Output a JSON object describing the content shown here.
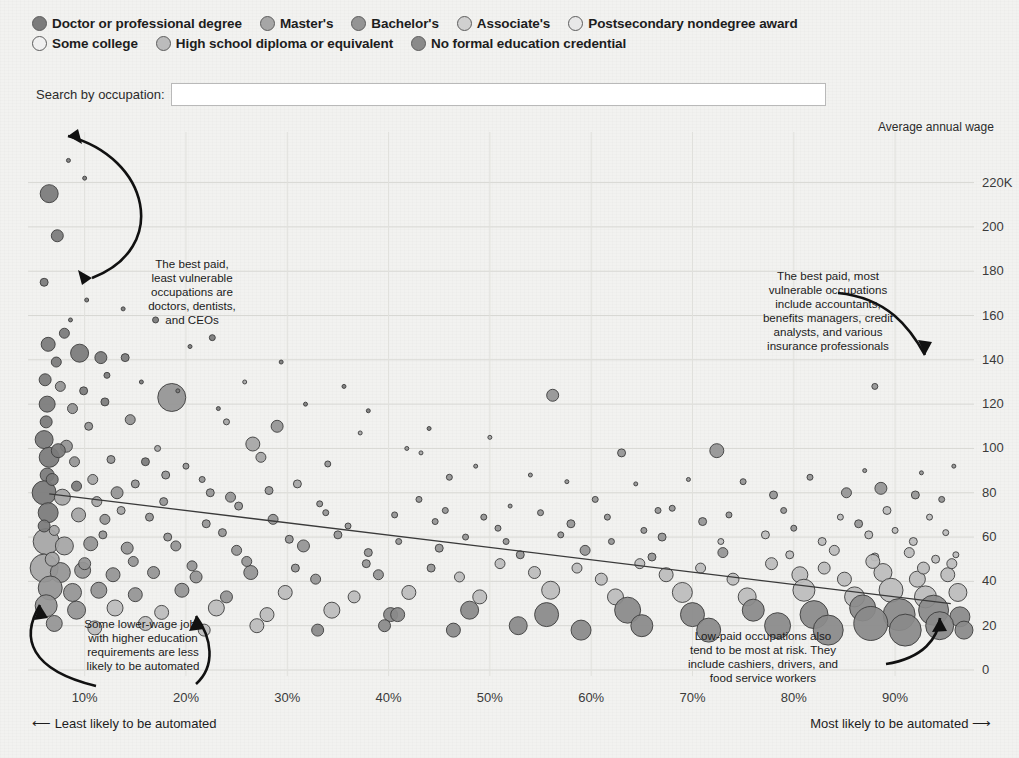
{
  "legend": {
    "rows": [
      [
        {
          "label": "Doctor or professional degree",
          "color": "#7b7b7b"
        },
        {
          "label": "Master's",
          "color": "#a6a6a6"
        },
        {
          "label": "Bachelor's",
          "color": "#949494"
        },
        {
          "label": "Associate's",
          "color": "#d0d0d0"
        },
        {
          "label": "Postsecondary nondegree award",
          "color": "#e2e2e2"
        }
      ],
      [
        {
          "label": "Some college",
          "color": "#ececec"
        },
        {
          "label": "High school diploma or equivalent",
          "color": "#bcbcbc"
        },
        {
          "label": "No formal education credential",
          "color": "#8a8a8a"
        }
      ]
    ]
  },
  "search": {
    "label": "Search by occupation:",
    "value": "",
    "placeholder": ""
  },
  "annotations": [
    {
      "name": "top-left-annotation",
      "lines": [
        "The best paid,",
        "least vulnerable",
        "occupations are",
        "doctors, dentists,",
        "and CEOs"
      ],
      "x": 192,
      "y": 150
    },
    {
      "name": "top-right-annotation",
      "lines": [
        "The best paid, most",
        "vulnerable occupations",
        "include accountants,",
        "benefits managers, credit",
        "analysts, and various",
        "insurance professionals"
      ],
      "x": 828,
      "y": 162
    },
    {
      "name": "bottom-left-annotation",
      "lines": [
        "Some lower-wage jobs",
        "with higher education",
        "requirements are less",
        "likely to be automated"
      ],
      "x": 143,
      "y": 510
    },
    {
      "name": "bottom-right-annotation",
      "lines": [
        "Low-paid occupations also",
        "tend to be most at risk. They",
        "include cashiers, drivers, and",
        "food service workers"
      ],
      "x": 763,
      "y": 522
    }
  ],
  "footer": {
    "left": "Least likely to be automated",
    "right": "Most likely to be automated"
  },
  "chart_data": {
    "type": "scatter",
    "title": "",
    "xlabel": "",
    "ylabel": "Average annual wage",
    "xlim": [
      5,
      97
    ],
    "ylim": [
      0,
      232
    ],
    "grid": true,
    "legend_position": "top",
    "x_ticks": [
      10,
      20,
      30,
      40,
      50,
      60,
      70,
      80,
      90
    ],
    "x_tick_labels": [
      "10%",
      "20%",
      "30%",
      "40%",
      "50%",
      "60%",
      "70%",
      "80%",
      "90%"
    ],
    "y_ticks": [
      0,
      20,
      40,
      60,
      80,
      100,
      120,
      140,
      160,
      180,
      200,
      220
    ],
    "y_tick_labels": [
      "0",
      "20",
      "40",
      "60",
      "80",
      "100",
      "120",
      "140",
      "160",
      "180",
      "200",
      "220K"
    ],
    "trendline": {
      "x0": 6.5,
      "y0": 79.5,
      "x1": 95.5,
      "y1": 30.0
    },
    "categories": [
      "Doctor or professional degree",
      "Master's",
      "Bachelor's",
      "Associate's",
      "Postsecondary nondegree award",
      "Some college",
      "High school diploma or equivalent",
      "No formal education credential"
    ],
    "category_colors": [
      "#7b7b7b",
      "#a6a6a6",
      "#949494",
      "#d0d0d0",
      "#e2e2e2",
      "#ececec",
      "#bcbcbc",
      "#8a8a8a"
    ],
    "size_encoding": "number of people employed",
    "points": [
      [
        6.5,
        215,
        9,
        0
      ],
      [
        7.3,
        196,
        6,
        0
      ],
      [
        6.0,
        175,
        4,
        0
      ],
      [
        8.4,
        230,
        2,
        0
      ],
      [
        10.0,
        222,
        2,
        0
      ],
      [
        6.4,
        147,
        7,
        0
      ],
      [
        8.0,
        152,
        5,
        0
      ],
      [
        9.5,
        143,
        9,
        0
      ],
      [
        7.2,
        139,
        5,
        0
      ],
      [
        11.6,
        141,
        6,
        0
      ],
      [
        14.0,
        141,
        4,
        0
      ],
      [
        22.6,
        150,
        3,
        0
      ],
      [
        6.1,
        131,
        6,
        0
      ],
      [
        7.6,
        128,
        5,
        2
      ],
      [
        9.9,
        126,
        4,
        0
      ],
      [
        6.3,
        120,
        8,
        0
      ],
      [
        8.8,
        118,
        5,
        2
      ],
      [
        12.0,
        121,
        4,
        0
      ],
      [
        18.6,
        123,
        14,
        2
      ],
      [
        6.2,
        112,
        6,
        0
      ],
      [
        10.4,
        110,
        4,
        2
      ],
      [
        14.5,
        113,
        5,
        2
      ],
      [
        24.0,
        112,
        3,
        1
      ],
      [
        29.0,
        110,
        6,
        2
      ],
      [
        6.0,
        104,
        9,
        0
      ],
      [
        8.2,
        101,
        6,
        2
      ],
      [
        17.2,
        100,
        3,
        1
      ],
      [
        26.6,
        102,
        7,
        1
      ],
      [
        41.8,
        100,
        2,
        2
      ],
      [
        6.5,
        96,
        10,
        0
      ],
      [
        9.0,
        94,
        5,
        2
      ],
      [
        12.6,
        95,
        4,
        2
      ],
      [
        20.0,
        92,
        3,
        2
      ],
      [
        27.4,
        96,
        5,
        1
      ],
      [
        34.0,
        93,
        3,
        2
      ],
      [
        56.2,
        124,
        6,
        2
      ],
      [
        6.3,
        88,
        7,
        0
      ],
      [
        10.8,
        86,
        5,
        1
      ],
      [
        15.0,
        84,
        4,
        2
      ],
      [
        21.6,
        86,
        3,
        2
      ],
      [
        31.0,
        84,
        4,
        1
      ],
      [
        46.0,
        87,
        3,
        2
      ],
      [
        63.0,
        98,
        4,
        2
      ],
      [
        72.4,
        99,
        7,
        2
      ],
      [
        6.0,
        80,
        12,
        0
      ],
      [
        7.8,
        78,
        8,
        1
      ],
      [
        13.2,
        80,
        6,
        2
      ],
      [
        17.8,
        76,
        4,
        2
      ],
      [
        24.4,
        78,
        5,
        2
      ],
      [
        33.2,
        75,
        3,
        2
      ],
      [
        43.0,
        77,
        3,
        2
      ],
      [
        52.0,
        74,
        2,
        2
      ],
      [
        60.4,
        77,
        3,
        2
      ],
      [
        68.0,
        73,
        3,
        2
      ],
      [
        78.0,
        79,
        4,
        2
      ],
      [
        85.2,
        80,
        5,
        2
      ],
      [
        88.6,
        82,
        6,
        2
      ],
      [
        92.0,
        79,
        4,
        2
      ],
      [
        94.6,
        77,
        3,
        2
      ],
      [
        6.4,
        71,
        10,
        0
      ],
      [
        9.4,
        70,
        7,
        1
      ],
      [
        12.0,
        68,
        5,
        2
      ],
      [
        16.4,
        69,
        4,
        2
      ],
      [
        22.0,
        66,
        4,
        2
      ],
      [
        28.6,
        68,
        5,
        2
      ],
      [
        36.0,
        65,
        3,
        2
      ],
      [
        44.6,
        67,
        3,
        2
      ],
      [
        50.8,
        64,
        3,
        2
      ],
      [
        58.0,
        66,
        4,
        2
      ],
      [
        65.2,
        63,
        3,
        2
      ],
      [
        71.0,
        67,
        4,
        2
      ],
      [
        80.0,
        64,
        3,
        2
      ],
      [
        86.4,
        66,
        4,
        2
      ],
      [
        90.0,
        63,
        3,
        6
      ],
      [
        95.0,
        62,
        3,
        6
      ],
      [
        6.2,
        58,
        13,
        1
      ],
      [
        8.0,
        56,
        9,
        1
      ],
      [
        10.6,
        57,
        7,
        2
      ],
      [
        14.2,
        55,
        6,
        2
      ],
      [
        19.0,
        56,
        5,
        2
      ],
      [
        25.0,
        54,
        5,
        2
      ],
      [
        31.6,
        56,
        6,
        2
      ],
      [
        38.0,
        53,
        4,
        2
      ],
      [
        45.0,
        55,
        4,
        2
      ],
      [
        53.0,
        52,
        4,
        2
      ],
      [
        59.4,
        54,
        5,
        2
      ],
      [
        66.0,
        51,
        4,
        2
      ],
      [
        73.0,
        53,
        5,
        2
      ],
      [
        79.6,
        52,
        4,
        6
      ],
      [
        84.0,
        54,
        5,
        6
      ],
      [
        88.0,
        51,
        4,
        6
      ],
      [
        91.4,
        53,
        5,
        6
      ],
      [
        94.0,
        50,
        4,
        6
      ],
      [
        96.0,
        52,
        3,
        6
      ],
      [
        6.0,
        46,
        14,
        1
      ],
      [
        7.6,
        44,
        10,
        2
      ],
      [
        9.8,
        45,
        8,
        2
      ],
      [
        12.8,
        43,
        7,
        2
      ],
      [
        16.8,
        44,
        6,
        2
      ],
      [
        21.0,
        42,
        6,
        2
      ],
      [
        26.4,
        44,
        7,
        2
      ],
      [
        32.8,
        41,
        5,
        2
      ],
      [
        39.0,
        43,
        5,
        2
      ],
      [
        47.0,
        42,
        5,
        6
      ],
      [
        54.4,
        44,
        6,
        6
      ],
      [
        61.0,
        41,
        6,
        6
      ],
      [
        67.4,
        43,
        7,
        6
      ],
      [
        74.0,
        41,
        6,
        6
      ],
      [
        80.6,
        43,
        8,
        6
      ],
      [
        85.0,
        41,
        7,
        6
      ],
      [
        88.8,
        44,
        9,
        6
      ],
      [
        92.2,
        41,
        8,
        6
      ],
      [
        95.2,
        43,
        7,
        6
      ],
      [
        6.6,
        37,
        12,
        2
      ],
      [
        8.8,
        35,
        9,
        2
      ],
      [
        11.4,
        36,
        8,
        2
      ],
      [
        15.0,
        34,
        7,
        2
      ],
      [
        19.6,
        36,
        7,
        2
      ],
      [
        24.0,
        33,
        6,
        2
      ],
      [
        29.8,
        35,
        7,
        6
      ],
      [
        36.6,
        33,
        6,
        6
      ],
      [
        42.0,
        35,
        7,
        6
      ],
      [
        49.0,
        33,
        7,
        6
      ],
      [
        56.0,
        36,
        9,
        6
      ],
      [
        62.4,
        33,
        8,
        6
      ],
      [
        69.0,
        35,
        10,
        6
      ],
      [
        75.4,
        33,
        9,
        6
      ],
      [
        81.0,
        36,
        11,
        6
      ],
      [
        86.0,
        33,
        10,
        6
      ],
      [
        89.6,
        36,
        12,
        6
      ],
      [
        93.0,
        33,
        11,
        6
      ],
      [
        96.2,
        35,
        9,
        6
      ],
      [
        6.2,
        29,
        11,
        2
      ],
      [
        9.2,
        27,
        9,
        2
      ],
      [
        13.0,
        28,
        8,
        6
      ],
      [
        17.6,
        26,
        7,
        6
      ],
      [
        23.0,
        28,
        8,
        6
      ],
      [
        28.0,
        25,
        7,
        6
      ],
      [
        34.4,
        27,
        8,
        6
      ],
      [
        40.2,
        25,
        7,
        7
      ],
      [
        40.9,
        25,
        7,
        7
      ],
      [
        48.0,
        27,
        9,
        7
      ],
      [
        55.6,
        25,
        12,
        7
      ],
      [
        63.6,
        27,
        13,
        7
      ],
      [
        70.0,
        25,
        12,
        7
      ],
      [
        76.0,
        27,
        11,
        7
      ],
      [
        82.0,
        25,
        14,
        7
      ],
      [
        86.8,
        28,
        13,
        7
      ],
      [
        90.4,
        25,
        16,
        7
      ],
      [
        93.8,
        27,
        15,
        7
      ],
      [
        96.4,
        24,
        10,
        7
      ],
      [
        7.0,
        21,
        8,
        2
      ],
      [
        11.0,
        19,
        7,
        6
      ],
      [
        16.0,
        21,
        7,
        6
      ],
      [
        21.8,
        18,
        6,
        6
      ],
      [
        27.0,
        20,
        7,
        6
      ],
      [
        33.0,
        18,
        6,
        7
      ],
      [
        39.6,
        20,
        6,
        7
      ],
      [
        46.4,
        18,
        7,
        7
      ],
      [
        52.8,
        20,
        9,
        7
      ],
      [
        59.0,
        18,
        10,
        7
      ],
      [
        65.0,
        20,
        11,
        7
      ],
      [
        71.6,
        18,
        12,
        7
      ],
      [
        78.4,
        20,
        13,
        7
      ],
      [
        83.4,
        18,
        15,
        7
      ],
      [
        87.6,
        21,
        17,
        7
      ],
      [
        91.0,
        18,
        16,
        7
      ],
      [
        94.4,
        20,
        14,
        7
      ],
      [
        96.8,
        18,
        9,
        7
      ],
      [
        88.0,
        128,
        3,
        2
      ],
      [
        38.0,
        117,
        2,
        0
      ],
      [
        44.0,
        109,
        2,
        0
      ],
      [
        50.0,
        105,
        2,
        1
      ],
      [
        35.6,
        128,
        2,
        0
      ],
      [
        29.4,
        139,
        2,
        0
      ],
      [
        13.8,
        163,
        2,
        0
      ],
      [
        17.0,
        158,
        3,
        0
      ],
      [
        20.4,
        146,
        2,
        0
      ],
      [
        10.2,
        167,
        2,
        0
      ],
      [
        8.6,
        158,
        2,
        0
      ],
      [
        12.2,
        133,
        3,
        0
      ],
      [
        15.6,
        130,
        2,
        0
      ],
      [
        19.2,
        126,
        2,
        0
      ],
      [
        23.2,
        118,
        2,
        0
      ],
      [
        25.8,
        130,
        2,
        1
      ],
      [
        31.8,
        120,
        2,
        0
      ],
      [
        37.2,
        107,
        2,
        1
      ],
      [
        43.2,
        98,
        2,
        1
      ],
      [
        48.6,
        92,
        2,
        2
      ],
      [
        54.0,
        88,
        2,
        2
      ],
      [
        57.6,
        85,
        2,
        2
      ],
      [
        64.4,
        84,
        2,
        2
      ],
      [
        69.6,
        86,
        2,
        2
      ],
      [
        75.0,
        85,
        3,
        2
      ],
      [
        81.6,
        87,
        3,
        2
      ],
      [
        87.0,
        90,
        2,
        2
      ],
      [
        92.6,
        89,
        2,
        2
      ],
      [
        95.8,
        92,
        2,
        2
      ],
      [
        7.0,
        63,
        5,
        1
      ],
      [
        11.8,
        61,
        4,
        2
      ],
      [
        18.2,
        60,
        4,
        2
      ],
      [
        23.6,
        62,
        4,
        2
      ],
      [
        30.2,
        59,
        4,
        2
      ],
      [
        35.0,
        61,
        4,
        2
      ],
      [
        41.0,
        58,
        3,
        2
      ],
      [
        47.6,
        60,
        3,
        2
      ],
      [
        51.6,
        58,
        3,
        2
      ],
      [
        57.0,
        61,
        3,
        2
      ],
      [
        62.0,
        58,
        3,
        2
      ],
      [
        67.0,
        60,
        4,
        2
      ],
      [
        72.8,
        58,
        3,
        6
      ],
      [
        77.2,
        61,
        4,
        6
      ],
      [
        82.8,
        58,
        4,
        6
      ],
      [
        87.4,
        61,
        4,
        6
      ],
      [
        91.8,
        58,
        4,
        6
      ],
      [
        6.8,
        50,
        7,
        1
      ],
      [
        10.0,
        48,
        6,
        2
      ],
      [
        14.8,
        49,
        5,
        2
      ],
      [
        20.6,
        47,
        5,
        2
      ],
      [
        26.0,
        49,
        5,
        2
      ],
      [
        30.8,
        46,
        4,
        2
      ],
      [
        37.8,
        48,
        4,
        2
      ],
      [
        44.2,
        46,
        4,
        2
      ],
      [
        51.0,
        48,
        5,
        6
      ],
      [
        58.6,
        46,
        5,
        6
      ],
      [
        64.8,
        48,
        5,
        6
      ],
      [
        70.8,
        46,
        5,
        6
      ],
      [
        77.8,
        48,
        6,
        6
      ],
      [
        83.0,
        46,
        6,
        6
      ],
      [
        87.8,
        49,
        7,
        6
      ],
      [
        92.8,
        46,
        6,
        6
      ],
      [
        95.6,
        48,
        5,
        6
      ],
      [
        6.0,
        65,
        6,
        0
      ],
      [
        6.8,
        86,
        6,
        0
      ],
      [
        7.4,
        99,
        7,
        0
      ],
      [
        9.2,
        83,
        5,
        0
      ],
      [
        11.2,
        76,
        5,
        1
      ],
      [
        13.6,
        72,
        4,
        1
      ],
      [
        16.0,
        94,
        4,
        0
      ],
      [
        18.0,
        88,
        4,
        2
      ],
      [
        22.4,
        80,
        4,
        2
      ],
      [
        25.2,
        74,
        4,
        2
      ],
      [
        28.2,
        81,
        4,
        2
      ],
      [
        33.8,
        71,
        3,
        2
      ],
      [
        40.6,
        70,
        3,
        2
      ],
      [
        45.6,
        72,
        3,
        2
      ],
      [
        49.4,
        69,
        3,
        2
      ],
      [
        55.0,
        71,
        3,
        2
      ],
      [
        61.6,
        69,
        3,
        2
      ],
      [
        66.6,
        72,
        3,
        2
      ],
      [
        73.6,
        70,
        3,
        2
      ],
      [
        79.0,
        72,
        3,
        2
      ],
      [
        84.6,
        69,
        3,
        6
      ],
      [
        89.2,
        72,
        4,
        6
      ],
      [
        93.4,
        69,
        3,
        6
      ]
    ]
  }
}
